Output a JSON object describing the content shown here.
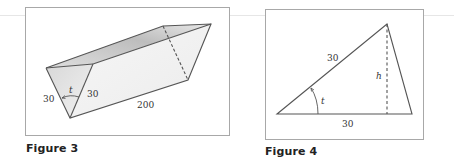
{
  "figures": [
    {
      "caption": "Figure 3",
      "labels": {
        "left_side": "30",
        "right_side": "30",
        "angle": "t",
        "length": "200"
      }
    },
    {
      "caption": "Figure 4",
      "labels": {
        "hypotenuse": "30",
        "angle": "t",
        "height": "h",
        "base": "30"
      }
    }
  ],
  "colors": {
    "stroke": "#555555",
    "border": "#a8a8a8",
    "face_light": "#f0f0f0",
    "face_shade": "#cfcfcf"
  }
}
